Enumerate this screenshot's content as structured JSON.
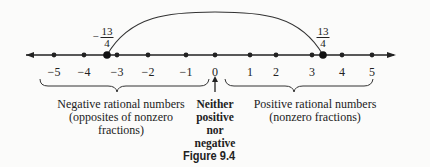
{
  "diagram": {
    "type": "number-line",
    "ticks": [
      {
        "value": -5,
        "label": "−5",
        "x": 54
      },
      {
        "value": -4,
        "label": "−4",
        "x": 84
      },
      {
        "value": -3,
        "label": "−3",
        "x": 117
      },
      {
        "value": -2,
        "label": "−2",
        "x": 148
      },
      {
        "value": -1,
        "label": "−1",
        "x": 186
      },
      {
        "value": 0,
        "label": "0",
        "x": 215
      },
      {
        "value": 1,
        "label": "1",
        "x": 250
      },
      {
        "value": 2,
        "label": "2",
        "x": 276
      },
      {
        "value": 3,
        "label": "3",
        "x": 312
      },
      {
        "value": 4,
        "label": "4",
        "x": 342
      },
      {
        "value": 5,
        "label": "5",
        "x": 372
      }
    ],
    "highlighted_points": [
      {
        "label": "−13/4",
        "sign": "−",
        "numerator": "13",
        "denominator": "4",
        "x": 107
      },
      {
        "label": "13/4",
        "sign": "",
        "numerator": "13",
        "denominator": "4",
        "x": 323
      }
    ],
    "negative_label": [
      "Negative rational numbers",
      "(opposites of nonzero",
      "fractions)"
    ],
    "zero_label": [
      "Neither",
      "positive",
      "nor",
      "negative"
    ],
    "positive_label": [
      "Positive rational numbers",
      "(nonzero fractions)"
    ],
    "figure_caption": "Figure 9.4"
  }
}
